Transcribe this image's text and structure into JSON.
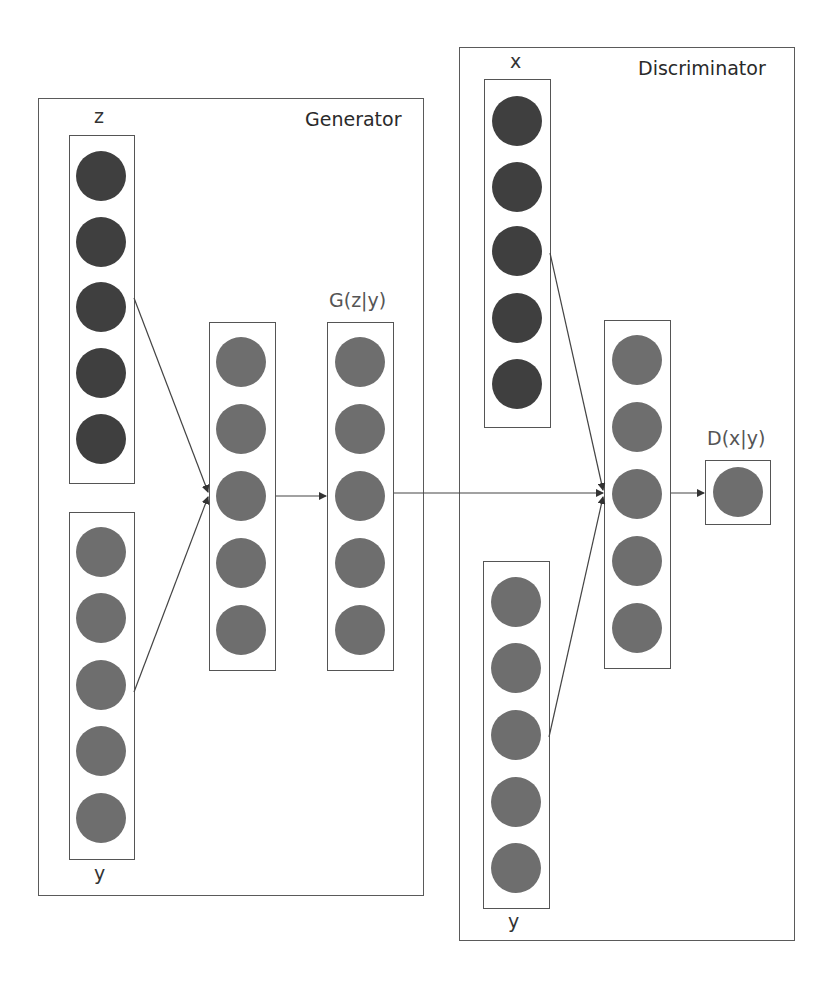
{
  "diagram": {
    "type": "conditional-gan-architecture",
    "colors": {
      "panel_border": "#5a5a5a",
      "layer_border": "#555555",
      "node_dark": "#3f3f3f",
      "node_light": "#6e6e6e",
      "wire": "#444444"
    },
    "generator": {
      "title": "Generator",
      "layers": [
        {
          "id": "z",
          "label": "z",
          "nodes": 5,
          "shade": "dark"
        },
        {
          "id": "gen_y",
          "label": "y",
          "nodes": 5,
          "shade": "light"
        },
        {
          "id": "gen_hidden",
          "label": "",
          "nodes": 5,
          "shade": "light"
        },
        {
          "id": "gen_output",
          "label": "G(z|y)",
          "nodes": 5,
          "shade": "light"
        }
      ]
    },
    "discriminator": {
      "title": "Discriminator",
      "layers": [
        {
          "id": "x",
          "label": "x",
          "nodes": 5,
          "shade": "dark"
        },
        {
          "id": "disc_y",
          "label": "y",
          "nodes": 5,
          "shade": "light"
        },
        {
          "id": "disc_hidden",
          "label": "",
          "nodes": 5,
          "shade": "light"
        },
        {
          "id": "disc_output",
          "label": "D(x|y)",
          "nodes": 1,
          "shade": "light"
        }
      ]
    },
    "connections": [
      {
        "from": "z",
        "to": "gen_hidden"
      },
      {
        "from": "gen_y",
        "to": "gen_hidden"
      },
      {
        "from": "gen_hidden",
        "to": "gen_output"
      },
      {
        "from": "gen_output",
        "to": "disc_hidden"
      },
      {
        "from": "x",
        "to": "disc_hidden"
      },
      {
        "from": "disc_y",
        "to": "disc_hidden"
      },
      {
        "from": "disc_hidden",
        "to": "disc_output"
      }
    ]
  }
}
